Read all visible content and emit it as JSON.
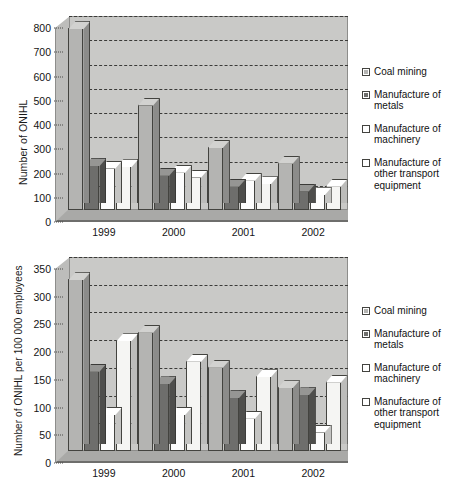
{
  "charts": [
    {
      "id": "top",
      "ylabel": "Number of ONIHL",
      "yticks": [
        "0",
        "100",
        "200",
        "300",
        "400",
        "500",
        "600",
        "700",
        "800"
      ],
      "categories": [
        "1999",
        "2000",
        "2001",
        "2002"
      ],
      "legend": [
        {
          "label": "Coal mining",
          "swatch": "coal-swatch"
        },
        {
          "label": "Manufacture of metals",
          "swatch": "metals-swatch"
        },
        {
          "label": "Manufacture of machinery",
          "swatch": "machinery-swatch"
        },
        {
          "label": "Manufacture of other transport equipment",
          "swatch": "other-transport-swatch"
        }
      ]
    },
    {
      "id": "bottom",
      "ylabel": "Number of ONIHL per 100 000 employees",
      "yticks": [
        "0",
        "50",
        "100",
        "150",
        "200",
        "250",
        "300",
        "350"
      ],
      "categories": [
        "1999",
        "2000",
        "2001",
        "2002"
      ],
      "legend": [
        {
          "label": "Coal mining",
          "swatch": "coal-swatch"
        },
        {
          "label": "Manufacture of metals",
          "swatch": "metals-swatch"
        },
        {
          "label": "Manufacture of machinery",
          "swatch": "machinery-swatch"
        },
        {
          "label": "Manufacture of other transport equipment",
          "swatch": "other-transport-swatch"
        }
      ]
    }
  ],
  "chart_data": [
    {
      "type": "bar",
      "title": "",
      "xlabel": "",
      "ylabel": "Number of ONIHL",
      "categories": [
        "1999",
        "2000",
        "2001",
        "2002"
      ],
      "ylim": [
        0,
        800
      ],
      "ytick_step": 100,
      "grid": true,
      "legend_position": "right",
      "series": [
        {
          "name": "Coal mining",
          "values": [
            750,
            435,
            260,
            195
          ]
        },
        {
          "name": "Manufacture of metals",
          "values": [
            185,
            145,
            100,
            80
          ]
        },
        {
          "name": "Manufacture of machinery",
          "values": [
            175,
            158,
            125,
            65
          ]
        },
        {
          "name": "Manufacture of other transport equipment",
          "values": [
            180,
            138,
            110,
            100
          ]
        }
      ]
    },
    {
      "type": "bar",
      "title": "",
      "xlabel": "",
      "ylabel": "Number of ONIHL per 100 000 employees",
      "categories": [
        "1999",
        "2000",
        "2001",
        "2002"
      ],
      "ylim": [
        0,
        350
      ],
      "ytick_step": 50,
      "grid": true,
      "legend_position": "right",
      "series": [
        {
          "name": "Coal mining",
          "values": [
            310,
            215,
            152,
            115
          ]
        },
        {
          "name": "Manufacture of metals",
          "values": [
            145,
            122,
            97,
            102
          ]
        },
        {
          "name": "Manufacture of machinery",
          "values": [
            67,
            67,
            60,
            35
          ]
        },
        {
          "name": "Manufacture of other transport equipment",
          "values": [
            200,
            163,
            135,
            125
          ]
        }
      ]
    }
  ]
}
